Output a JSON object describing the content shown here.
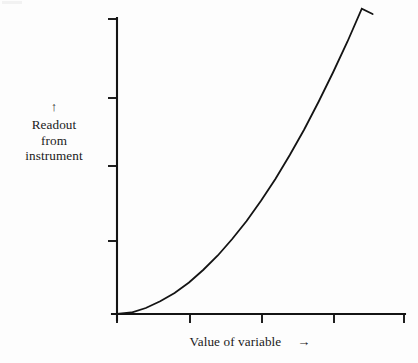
{
  "figure": {
    "background_color": "#fdfdfd",
    "ink_color": "#141414"
  },
  "axes": {
    "y_label_arrow": "↑",
    "y_label_line1": "Readout",
    "y_label_line2": "from",
    "y_label_line3": "instrument",
    "x_label_text": "Value of variable",
    "x_label_arrow": "→"
  },
  "chart_data": {
    "type": "line",
    "title": "",
    "xlabel": "Value of variable",
    "ylabel": "Readout from instrument",
    "grid": false,
    "legend": null,
    "axis_style": "unlabeled ticks, open axes with end caps",
    "xlim": [
      0,
      4
    ],
    "ylim": [
      0,
      4
    ],
    "x_ticks": [
      0,
      1,
      2,
      3,
      4
    ],
    "x_tick_labels": [
      "",
      "",
      "",
      "",
      ""
    ],
    "y_ticks": [
      0,
      1,
      2,
      3,
      4
    ],
    "y_tick_labels": [
      "",
      "",
      "",
      "",
      ""
    ],
    "annotations": [],
    "series": [
      {
        "name": "instrument response",
        "shape": "monotonic increasing, concave up (power-law, exponent ~1.8)",
        "x": [
          0.0,
          0.2,
          0.4,
          0.6,
          0.8,
          1.0,
          1.2,
          1.4,
          1.6,
          1.8,
          2.0,
          2.2,
          2.4,
          2.6,
          2.8,
          3.0,
          3.2,
          3.4,
          3.55
        ],
        "y": [
          0.0,
          0.02,
          0.08,
          0.17,
          0.28,
          0.42,
          0.59,
          0.78,
          1.0,
          1.24,
          1.51,
          1.8,
          2.12,
          2.46,
          2.83,
          3.22,
          3.63,
          4.07,
          4.0
        ]
      }
    ]
  }
}
